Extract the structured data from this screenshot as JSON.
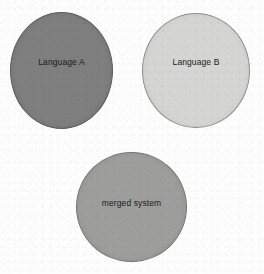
{
  "figure": {
    "background_color": "#fdfdfd",
    "width": 264,
    "height": 274
  },
  "nodes": [
    {
      "id": "language-a",
      "label": "Language A",
      "shape": "circle",
      "fill_color": "#807f7f",
      "stroke_color": "#5d5c5c",
      "position": "top-left"
    },
    {
      "id": "language-b",
      "label": "Language B",
      "shape": "circle",
      "fill_color": "#d5d5d3",
      "stroke_color": "#8f8f8f",
      "position": "top-right"
    },
    {
      "id": "merged-system",
      "label": "merged system",
      "shape": "circle",
      "fill_color": "#9e9e9d",
      "stroke_color": "#767675",
      "position": "bottom-center"
    }
  ]
}
